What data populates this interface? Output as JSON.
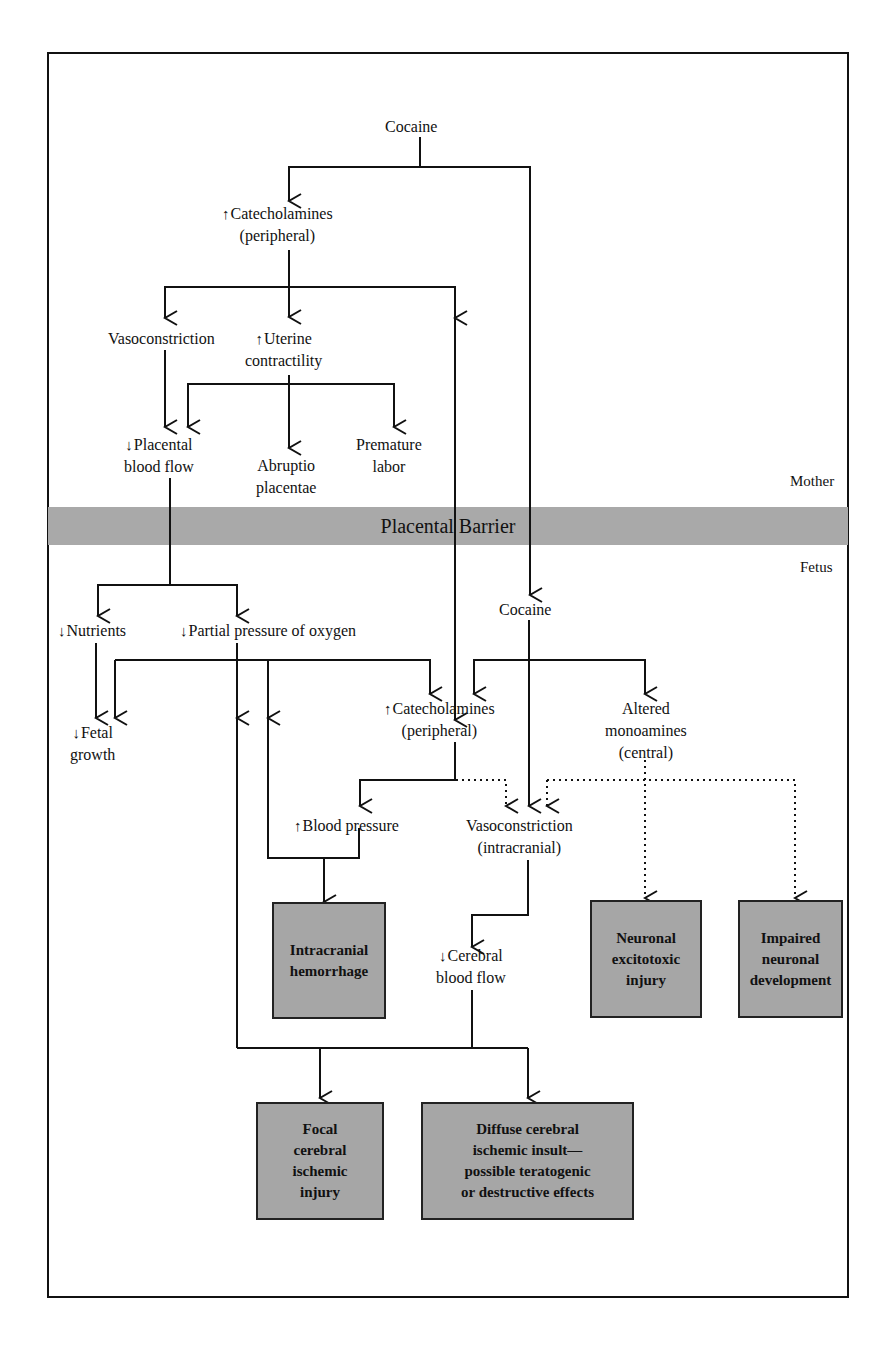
{
  "diagram": {
    "type": "flowchart",
    "regions": {
      "mother_label": "Mother",
      "fetus_label": "Fetus",
      "barrier_label": "Placental Barrier"
    },
    "symbols": {
      "increase": "↑",
      "decrease": "↓"
    },
    "nodes": {
      "cocaine_mother": {
        "text": "Cocaine"
      },
      "catechol_mother": {
        "prefix": "↑",
        "line1": "Catecholamines",
        "line2": "(peripheral)"
      },
      "vasoconstriction_mother": {
        "text": "Vasoconstriction"
      },
      "uterine": {
        "prefix": "↑",
        "line1": "Uterine",
        "line2": "contractility"
      },
      "placental_flow": {
        "prefix": "↓",
        "line1": "Placental",
        "line2": "blood flow"
      },
      "abruptio": {
        "line1": "Abruptio",
        "line2": "placentae"
      },
      "premature": {
        "line1": "Premature",
        "line2": "labor"
      },
      "nutrients": {
        "prefix": "↓",
        "text": "Nutrients"
      },
      "oxygen": {
        "prefix": "↓",
        "text": "Partial pressure of oxygen"
      },
      "cocaine_fetus": {
        "text": "Cocaine"
      },
      "fetal_growth": {
        "prefix": "↓",
        "line1": "Fetal",
        "line2": "growth"
      },
      "catechol_fetus": {
        "prefix": "↑",
        "line1": "Catecholamines",
        "line2": "(peripheral)"
      },
      "monoamines": {
        "line1": "Altered",
        "line2": "monoamines",
        "line3": "(central)"
      },
      "blood_pressure": {
        "prefix": "↑",
        "text": "Blood pressure"
      },
      "vasoconstriction_fetus": {
        "line1": "Vasoconstriction",
        "line2": "(intracranial)"
      },
      "cerebral_flow": {
        "prefix": "↓",
        "line1": "Cerebral",
        "line2": "blood flow"
      }
    },
    "outcomes": {
      "hemorrhage": "Intracranial\nhemorrhage",
      "excitotoxic": "Neuronal\nexcitotoxic\ninjury",
      "development": "Impaired\nneuronal\ndevelopment",
      "focal": "Focal\ncerebral\nischemic\ninjury",
      "diffuse": "Diffuse cerebral\nischemic insult—\npossible teratogenic\nor destructive effects"
    },
    "edge_styles": {
      "solid": "direct effect",
      "dotted": "indirect / central effect"
    },
    "colors": {
      "line": "#111111",
      "box_fill": "#a6a6a6",
      "barrier_fill": "#a9a9a9",
      "background": "#ffffff"
    }
  }
}
